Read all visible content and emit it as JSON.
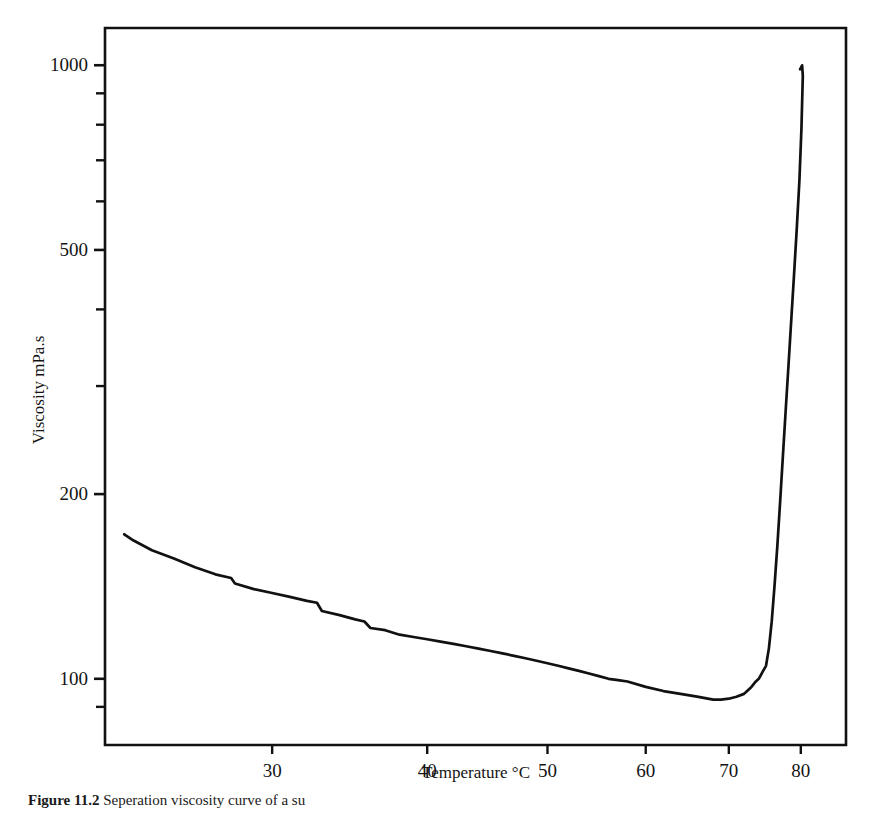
{
  "figure": {
    "caption_label": "Figure 11.2",
    "caption_text": "Seperation viscosity curve of a su",
    "background_color": "#ffffff",
    "ink_color": "#111111"
  },
  "chart_data": {
    "type": "line",
    "title": "",
    "xlabel": "Temperature °C",
    "ylabel": "Viscosity mPa.s",
    "xscale": "log",
    "yscale": "log",
    "xlim": [
      22,
      87
    ],
    "ylim": [
      78,
      1150
    ],
    "grid": false,
    "legend": "none",
    "x_ticks_major": [
      30,
      40,
      50,
      60,
      70,
      80
    ],
    "x_tick_labels": [
      "30",
      "40",
      "50",
      "60",
      "70",
      "80"
    ],
    "y_ticks_major": [
      100,
      200,
      500,
      1000
    ],
    "y_tick_labels": [
      "100",
      "200",
      "500",
      "1000"
    ],
    "y_ticks_minor": [
      90,
      300,
      400,
      600,
      700,
      800,
      900
    ],
    "series": [
      {
        "name": "Viscosity",
        "color": "#111111",
        "x": [
          22.8,
          23.2,
          24.0,
          25.0,
          26.0,
          27.0,
          27.8,
          28.0,
          29.0,
          30.0,
          31.0,
          32.0,
          32.6,
          32.9,
          34.0,
          35.0,
          35.6,
          36.0,
          37.0,
          38.0,
          39.0,
          40.0,
          41.0,
          42.0,
          43.0,
          44.0,
          45.0,
          46.0,
          47.0,
          48.0,
          49.0,
          50.0,
          51.0,
          52.0,
          53.0,
          54.0,
          55.0,
          56.0,
          57.0,
          58.0,
          60.0,
          62.0,
          64.0,
          66.0,
          68.0,
          69.0,
          70.0,
          71.0,
          72.0,
          72.6,
          73.0,
          73.6,
          74.0,
          74.6,
          75.0,
          75.4,
          75.8,
          76.2,
          76.6,
          77.0,
          77.4,
          77.8,
          78.2,
          78.6,
          79.0,
          79.4,
          79.8,
          80.1,
          80.3,
          80.2,
          79.9
        ],
        "y": [
          172,
          168,
          162,
          157,
          152,
          148,
          146,
          143,
          140,
          138,
          136,
          134,
          133,
          129,
          127,
          125,
          124,
          121,
          120,
          118,
          117,
          116,
          115,
          114,
          113,
          112,
          111,
          110,
          109,
          108,
          107,
          106,
          105,
          104,
          103,
          102,
          101,
          100,
          99.5,
          99,
          97,
          95.5,
          94.5,
          93.5,
          92.5,
          92.5,
          92.8,
          93.5,
          94.5,
          96,
          97,
          99,
          100,
          103,
          105,
          112,
          124,
          142,
          165,
          195,
          232,
          275,
          325,
          385,
          455,
          540,
          650,
          790,
          960,
          1000,
          985
        ],
        "annotations": []
      }
    ]
  },
  "axes": {
    "frame": {
      "left_px": 105,
      "right_px": 846,
      "top_px": 28,
      "bottom_px": 745
    }
  }
}
